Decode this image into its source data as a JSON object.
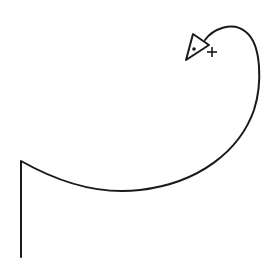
{
  "diagram": {
    "stroke_color": "#1a1a1a",
    "background": "#ffffff",
    "turtle": {
      "shape": "triangle",
      "has_center_dot": true,
      "marker": "+"
    }
  }
}
